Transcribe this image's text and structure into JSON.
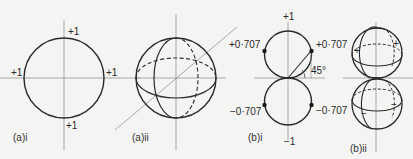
{
  "figure": {
    "panels": [
      {
        "id": "a-i",
        "caption": "(a)i",
        "labels": {
          "top": "+1",
          "bottom": "+1",
          "left": "+1",
          "right": "+1"
        }
      },
      {
        "id": "a-ii",
        "caption": "(a)ii"
      },
      {
        "id": "b-i",
        "caption": "(b)i",
        "labels": {
          "top": "+1",
          "bottom": "−1",
          "upper_left": "+0·707",
          "upper_right": "+0·707",
          "lower_left": "−0·707",
          "lower_right": "−0·707",
          "angle": "45°"
        }
      },
      {
        "id": "b-ii",
        "caption": "(b)ii",
        "labels": {
          "upper_left_sign": "+",
          "upper_right_sign": "+",
          "lower_left_sign": "−",
          "lower_right_sign": "−"
        }
      }
    ],
    "colors": {
      "line": "#2a2a2a",
      "axis": "#777777",
      "background": "#f4f4f2"
    }
  }
}
